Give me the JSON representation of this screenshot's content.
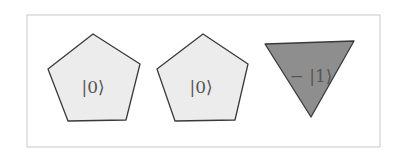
{
  "diagram": {
    "frame": {
      "x": 27,
      "y": 15,
      "width": 353,
      "height": 132,
      "stroke": "#c8c8c8"
    },
    "colors": {
      "light_fill": "#ececec",
      "dark_fill": "#8e8e8e",
      "outline": "#3a3a3a",
      "text": "#555555"
    },
    "shapes": [
      {
        "type": "pentagon",
        "label": "|0⟩",
        "fill": "#ececec",
        "points": "93,34 140,64 126,120 68,121 48,69",
        "label_x": 93,
        "label_y": 88
      },
      {
        "type": "pentagon",
        "label": "|0⟩",
        "fill": "#ececec",
        "points": "203,34 248,64 235,120 175,121 157,69",
        "label_x": 201,
        "label_y": 88
      },
      {
        "type": "inverted-triangle",
        "label": "− |1⟩",
        "fill": "#8e8e8e",
        "points": "265,44 354,41 311,117",
        "label_x": 311,
        "label_y": 77
      }
    ]
  }
}
